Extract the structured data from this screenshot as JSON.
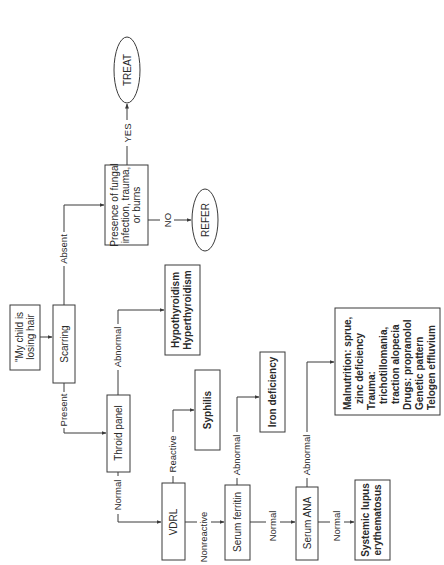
{
  "diagram": {
    "orientation": "rotated-90-ccw",
    "nodes": {
      "start": {
        "lines": [
          "\"My child is",
          "losing hair"
        ]
      },
      "scarring": {
        "lines": [
          "Scarring"
        ]
      },
      "fungal": {
        "lines": [
          "Presence of fungal",
          "infection, trauma,",
          "or burns"
        ]
      },
      "treat": {
        "lines": [
          "TREAT"
        ]
      },
      "refer": {
        "lines": [
          "REFER"
        ]
      },
      "thyroid_panel": {
        "lines": [
          "Throid panel"
        ]
      },
      "thyroid_dx": {
        "lines": [
          "Hypothyroidism",
          "Hyperthyroidism"
        ]
      },
      "vdrl": {
        "lines": [
          "VDRL"
        ]
      },
      "syphilis": {
        "lines": [
          "Syphilis"
        ]
      },
      "ferritin": {
        "lines": [
          "Serum ferritin"
        ]
      },
      "iron": {
        "lines": [
          "Iron deficiency"
        ]
      },
      "ana": {
        "lines": [
          "Serum ANA"
        ]
      },
      "other_dx": {
        "lines": [
          "Malnutrition: sprue,",
          "zinc deficiency",
          "Trauma:",
          "trichotillomania,",
          "traction alopecia",
          "Drugs: propranolol",
          "Genetic pattern",
          "Telogen effluvium"
        ]
      },
      "sle": {
        "lines": [
          "Systemic lupus",
          "erythematosus"
        ]
      }
    },
    "edges": {
      "scarring_absent": "Absent",
      "scarring_present": "Present",
      "fungal_yes": "YES",
      "fungal_no": "NO",
      "thyroid_abnormal": "Abnormal",
      "thyroid_normal": "Normal",
      "vdrl_reactive": "Reactive",
      "vdrl_nonreactive": "Nonreactive",
      "ferritin_abnormal": "Abnormal",
      "ferritin_normal": "Normal",
      "ana_abnormal": "Abnormal",
      "ana_normal": "Normal"
    }
  }
}
